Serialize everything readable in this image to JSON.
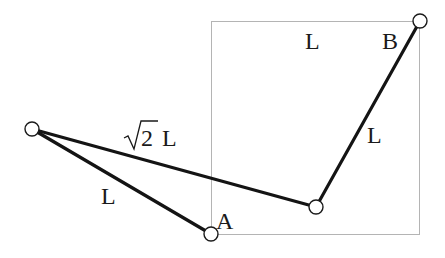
{
  "diagram": {
    "type": "linkage",
    "colors": {
      "background": "#ffffff",
      "rod": "#141414",
      "frame": "#b4b4b4",
      "text": "#1a1a1a"
    },
    "frame": {
      "label": "square",
      "side_label": "L"
    },
    "points": {
      "A": {
        "label": "A"
      },
      "B": {
        "label": "B"
      },
      "left_joint": {
        "label": ""
      },
      "middle_joint": {
        "label": ""
      }
    },
    "rods": [
      {
        "id": "left-to-A",
        "label": "L"
      },
      {
        "id": "left-to-middle",
        "label_radical": "2",
        "label_suffix": "L"
      },
      {
        "id": "middle-to-B",
        "label": "L"
      }
    ],
    "labels": {
      "top": "L",
      "right_rod": "L",
      "left_rod": "L",
      "diag_radicand": "2",
      "diag_suffix": "L",
      "point_a": "A",
      "point_b": "B"
    }
  }
}
